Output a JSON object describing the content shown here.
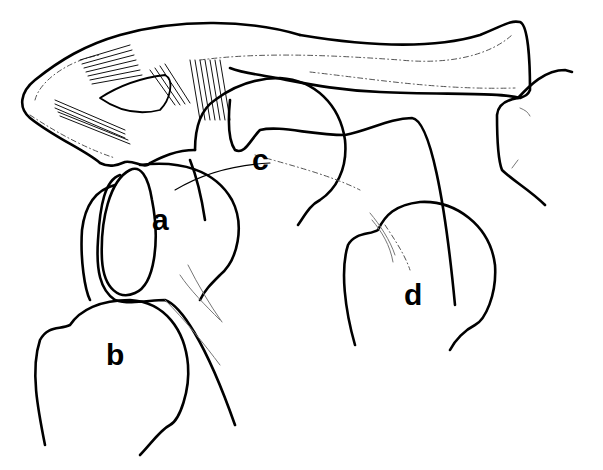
{
  "diagram": {
    "type": "anatomical line drawing",
    "labels": [
      {
        "id": "a",
        "text": "a",
        "x": 152,
        "y": 205
      },
      {
        "id": "b",
        "text": "b",
        "x": 106,
        "y": 340
      },
      {
        "id": "c",
        "text": "c",
        "x": 252,
        "y": 145
      },
      {
        "id": "d",
        "text": "d",
        "x": 404,
        "y": 280
      }
    ],
    "colors": {
      "line": "#000000",
      "background": "#ffffff",
      "dashed": "#555555"
    }
  }
}
